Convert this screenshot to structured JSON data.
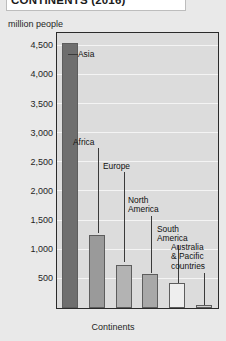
{
  "title": "CONTINENTS (2016)",
  "axes": {
    "y_caption": "million people",
    "x_caption": "Continents",
    "y_ticks": [
      "4,500",
      "4,000",
      "3,500",
      "3,000",
      "2,500",
      "2,000",
      "1,500",
      "1,000",
      "500"
    ]
  },
  "colors": {
    "plot_background": "#dcdcdc",
    "page_background": "#e9e9e9",
    "frame": "#2a2a2a",
    "gridline": "#f4f4f4",
    "bar_asia": "#6e6e6e",
    "bar_africa": "#9a9a9a",
    "bar_europe": "#b3b3b3",
    "bar_north_america": "#a8a8a8",
    "bar_south_america": "#eeeeee",
    "bar_australia": "#cfcfcf"
  },
  "chart_data": {
    "type": "bar",
    "title": "CONTINENTS (2016)",
    "xlabel": "Continents",
    "ylabel": "million people",
    "ylim": [
      0,
      4700
    ],
    "grid": true,
    "legend": "none",
    "categories": [
      "Asia",
      "Africa",
      "Europe",
      "North America",
      "South America",
      "Australia & Pacific countries"
    ],
    "values": [
      4550,
      1250,
      740,
      580,
      425,
      40
    ],
    "tick_values": [
      500,
      1000,
      1500,
      2000,
      2500,
      3000,
      3500,
      4000,
      4500
    ],
    "annotations": [
      {
        "label": "Asia",
        "value": 4550
      },
      {
        "label": "Africa",
        "value": 1250
      },
      {
        "label": "Europe",
        "value": 740
      },
      {
        "label": "North\nAmerica",
        "value": 580
      },
      {
        "label": "South\nAmerica",
        "value": 425
      },
      {
        "label": "Australia\n& Pacific\ncountries",
        "value": 40
      }
    ]
  },
  "labels": {
    "asia": "Asia",
    "africa": "Africa",
    "europe": "Europe",
    "north_america": "North\nAmerica",
    "south_america": "South\nAmerica",
    "australia": "Australia\n& Pacific\ncountries"
  }
}
